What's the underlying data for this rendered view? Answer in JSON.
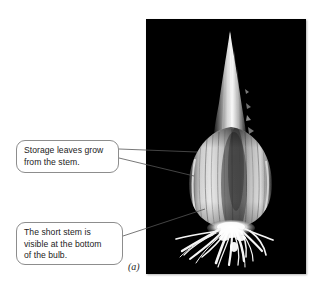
{
  "figure": {
    "panel_label": "(a)",
    "background_color": "#ffffff"
  },
  "photo": {
    "name": "bulb-photograph",
    "background_color": "#000000",
    "alt_description": "Black-background photograph of an onion bulb cut lengthwise, showing a pointed pale neck, a teardrop-shaped bulb body with vertical storage-leaf striations, and a mass of white roots at the base.",
    "parts": [
      {
        "name": "neck-spike",
        "color": "#f2f2f2"
      },
      {
        "name": "bulb-body",
        "color": "#d8d8d8"
      },
      {
        "name": "storage-leaf-striations",
        "color": "#9a9a9a"
      },
      {
        "name": "short-stem",
        "color": "#ededed"
      },
      {
        "name": "roots",
        "color": "#ffffff"
      }
    ]
  },
  "callouts": [
    {
      "name": "callout-storage-leaves",
      "lines": [
        "Storage leaves grow",
        "from the stem."
      ],
      "border_color": "#8d8d8d",
      "fill_color": "#ffffff",
      "text_color": "#1b1b1b",
      "leader_count": 2
    },
    {
      "name": "callout-short-stem",
      "lines": [
        "The short stem is",
        "visible at the bottom",
        "of the bulb."
      ],
      "border_color": "#8d8d8d",
      "fill_color": "#ffffff",
      "text_color": "#1b1b1b",
      "leader_count": 1
    }
  ],
  "leader_lines": {
    "color": "#555555",
    "width": 0.8
  }
}
